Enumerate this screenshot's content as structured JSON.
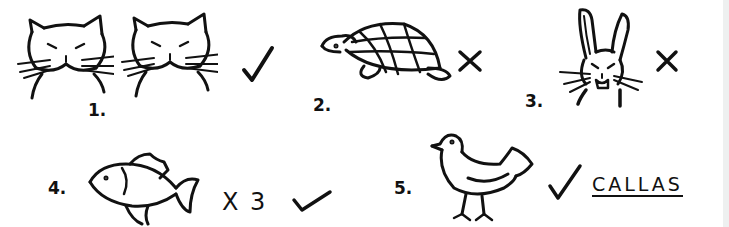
{
  "items": [
    {
      "number": "1.",
      "animal": "cat",
      "count": 2,
      "mark": "check",
      "mark_glyph": "✓"
    },
    {
      "number": "2.",
      "animal": "tortoise",
      "count": 1,
      "mark": "cross",
      "mark_glyph": "✕"
    },
    {
      "number": "3.",
      "animal": "rabbit",
      "count": 1,
      "mark": "cross",
      "mark_glyph": "✕"
    },
    {
      "number": "4.",
      "animal": "fish",
      "count": 3,
      "multiplier": "X 3",
      "mark": "check",
      "mark_glyph": "✓"
    },
    {
      "number": "5.",
      "animal": "bird",
      "count": 1,
      "mark": "check",
      "mark_glyph": "✓",
      "name": "CALLAS"
    }
  ],
  "colors": {
    "ink": "#111111",
    "paper": "#ffffff"
  }
}
